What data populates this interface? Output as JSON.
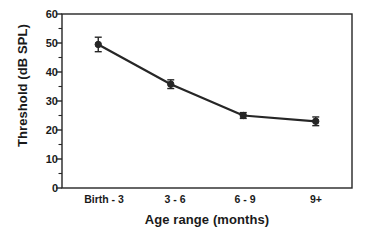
{
  "chart_data": {
    "type": "line",
    "title": "",
    "xlabel": "Age range (months)",
    "ylabel": "Threshold (dB SPL)",
    "categories": [
      "Birth - 3",
      "3 - 6",
      "6 - 9",
      "9+"
    ],
    "values": [
      49.5,
      35.8,
      25.0,
      23.0
    ],
    "errors": [
      2.5,
      1.5,
      1.0,
      1.5
    ],
    "ylim": [
      0,
      60
    ],
    "yticks": [
      0,
      10,
      20,
      30,
      40,
      50,
      60
    ],
    "ytick_labels": [
      "0",
      "10",
      "20",
      "30",
      "40",
      "50",
      "60"
    ],
    "yminor_step": 5,
    "grid": false,
    "legend": "none",
    "marker": "filled-circle",
    "line_color": "#262626",
    "marker_color": "#262626",
    "axis_color": "#262626",
    "background_color": "#ffffff"
  },
  "axis": {
    "y_label_text": "Threshold (dB SPL)",
    "x_label_text": "Age range (months)"
  }
}
